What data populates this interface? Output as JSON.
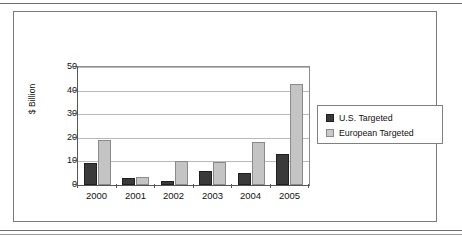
{
  "chart_data": {
    "type": "bar",
    "title": "",
    "xlabel": "",
    "ylabel": "$ Billion",
    "categories": [
      "2000",
      "2001",
      "2002",
      "2003",
      "2004",
      "2005"
    ],
    "series": [
      {
        "name": "U.S. Targeted",
        "color": "#3a3a3a",
        "values": [
          9.5,
          3.0,
          1.5,
          6.0,
          5.0,
          13.0
        ]
      },
      {
        "name": "European Targeted",
        "color": "#c4c4c4",
        "values": [
          19.0,
          3.5,
          10.0,
          9.7,
          18.4,
          43.0
        ]
      }
    ],
    "ylim": [
      0,
      50
    ],
    "yticks": [
      "0",
      "10",
      "20",
      "30",
      "40",
      "50"
    ],
    "grid": true,
    "legend_position": "right"
  },
  "legend": {
    "items": [
      {
        "label": "U.S. Targeted",
        "swatch": "dark-square-swatch"
      },
      {
        "label": "European Targeted",
        "swatch": "light-square-swatch"
      }
    ]
  },
  "axis": {
    "y_title": "$ Billion",
    "y_ticks": [
      "50",
      "40",
      "30",
      "20",
      "10",
      "0"
    ],
    "x_labels": [
      "2000",
      "2001",
      "2002",
      "2003",
      "2004",
      "2005"
    ]
  },
  "colors": {
    "us_bar": "#3a3a3a",
    "eu_bar": "#c4c4c4",
    "gridline": "#b9b9b9",
    "axis": "#555555",
    "frame": "#7a7a7a"
  }
}
